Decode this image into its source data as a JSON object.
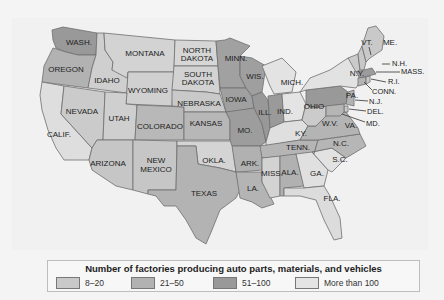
{
  "legend": {
    "title": "Number of factories producing auto parts, materials, and vehicles",
    "items": [
      {
        "label": "8–20",
        "color": "#c9c9c9"
      },
      {
        "label": "21–50",
        "color": "#b2b2b2"
      },
      {
        "label": "51–100",
        "color": "#999999"
      },
      {
        "label": "More than 100",
        "color": "#e4e4e4"
      }
    ]
  },
  "states": {
    "wash": "WASH.",
    "oregon": "OREGON",
    "calif": "CALIF.",
    "idaho": "IDAHO",
    "nevada": "NEVADA",
    "montana": "MONTANA",
    "wyoming": "WYOMING",
    "utah": "UTAH",
    "arizona": "ARIZONA",
    "colorado": "COLORADO",
    "new_mexico_1": "NEW",
    "new_mexico_2": "MEXICO",
    "north_dakota_1": "NORTH",
    "north_dakota_2": "DAKOTA",
    "south_dakota_1": "SOUTH",
    "south_dakota_2": "DAKOTA",
    "nebraska": "NEBRASKA",
    "kansas": "KANSAS",
    "okla": "OKLA.",
    "texas": "TEXAS",
    "minn": "MINN.",
    "iowa": "IOWA",
    "mo": "MO.",
    "ark": "ARK.",
    "la": "LA.",
    "wis": "WIS.",
    "ill": "ILL.",
    "mich": "MICH.",
    "ind": "IND.",
    "ohio": "OHIO",
    "ky": "KY.",
    "tenn": "TENN.",
    "miss": "MISS.",
    "ala": "ALA.",
    "ga": "GA.",
    "fla": "FLA.",
    "sc": "S.C.",
    "nc": "N.C.",
    "va": "VA.",
    "wv": "W.V.",
    "pa": "PA.",
    "ny": "N.Y.",
    "vt": "VT.",
    "me": "ME.",
    "nh": "N.H.",
    "mass": "MASS.",
    "ri": "R.I.",
    "conn": "CONN.",
    "nj": "N.J.",
    "del": "DEL.",
    "md": "MD."
  },
  "categories": {
    "8-20": [
      "Oregon",
      "California",
      "Idaho",
      "Nevada",
      "Montana",
      "Wyoming",
      "Utah",
      "Arizona",
      "New Mexico",
      "North Dakota",
      "South Dakota",
      "Nebraska",
      "Oklahoma",
      "Mississippi",
      "West Virginia",
      "Vermont",
      "Maine",
      "New Hampshire",
      "Rhode Island",
      "Delaware"
    ],
    "21-50": [
      "Colorado",
      "Kansas",
      "Texas",
      "Arkansas",
      "Louisiana",
      "Tennessee",
      "North Carolina",
      "Virginia",
      "Alabama",
      "Maryland",
      "Connecticut",
      "New Jersey"
    ],
    "51-100": [
      "Washington",
      "Minnesota",
      "Wisconsin",
      "Iowa",
      "Missouri",
      "Illinois",
      "Indiana",
      "Pennsylvania",
      "Massachusetts"
    ],
    "More than 100": [
      "Michigan",
      "Ohio",
      "Kentucky",
      "New York",
      "South Carolina",
      "Georgia",
      "Florida"
    ]
  }
}
